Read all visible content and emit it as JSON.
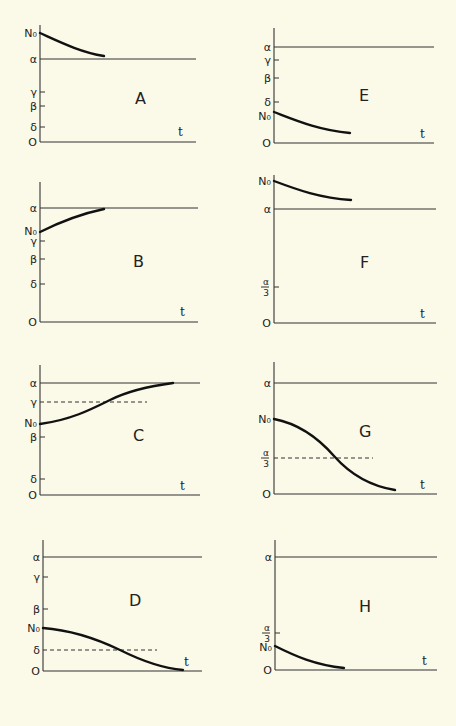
{
  "figure": {
    "background": "#fbf9e8",
    "ink": "#222222",
    "panels": [
      {
        "id": "A",
        "label": "A",
        "axis_x": 40,
        "zero_y": 142,
        "top_y": 25,
        "end_x": 196,
        "t_label": "t",
        "t_pos": [
          178,
          136
        ],
        "label_pos": [
          135,
          104
        ],
        "alpha_line_y": 59,
        "ticks": [
          {
            "name": "N0",
            "text": "N₀",
            "y": 33,
            "tick": false
          },
          {
            "name": "alpha",
            "text": "α",
            "y": 59,
            "tick": false
          },
          {
            "name": "gamma",
            "text": "γ",
            "y": 92,
            "tick": true
          },
          {
            "name": "beta",
            "text": "β",
            "y": 106,
            "tick": true
          },
          {
            "name": "delta",
            "text": "δ",
            "y": 127,
            "tick": true
          },
          {
            "name": "zero",
            "text": "O",
            "y": 142,
            "tick": false
          }
        ],
        "dashed": null,
        "curve": "M40 33 C 60 42, 80 52, 104 56"
      },
      {
        "id": "E",
        "label": "E",
        "axis_x": 274,
        "zero_y": 143,
        "top_y": 28,
        "end_x": 434,
        "t_label": "t",
        "t_pos": [
          420,
          138
        ],
        "label_pos": [
          359,
          101
        ],
        "alpha_line_y": 47,
        "ticks": [
          {
            "name": "alpha",
            "text": "α",
            "y": 47,
            "tick": false
          },
          {
            "name": "gamma",
            "text": "γ",
            "y": 60,
            "tick": true
          },
          {
            "name": "beta",
            "text": "β",
            "y": 78,
            "tick": true
          },
          {
            "name": "delta",
            "text": "δ",
            "y": 102,
            "tick": true
          },
          {
            "name": "N0",
            "text": "N₀",
            "y": 116,
            "tick": false
          },
          {
            "name": "zero",
            "text": "O",
            "y": 143,
            "tick": false
          }
        ],
        "dashed": null,
        "curve": "M274 112 C 295 120, 318 130, 350 133"
      },
      {
        "id": "B",
        "label": "B",
        "axis_x": 40,
        "zero_y": 322,
        "top_y": 182,
        "end_x": 198,
        "t_label": "t",
        "t_pos": [
          180,
          316
        ],
        "label_pos": [
          133,
          267
        ],
        "alpha_line_y": 208,
        "ticks": [
          {
            "name": "alpha",
            "text": "α",
            "y": 208,
            "tick": false
          },
          {
            "name": "N0",
            "text": "N₀",
            "y": 231,
            "tick": false
          },
          {
            "name": "gamma",
            "text": "γ",
            "y": 241,
            "tick": true
          },
          {
            "name": "beta",
            "text": "β",
            "y": 259,
            "tick": true
          },
          {
            "name": "delta",
            "text": "δ",
            "y": 284,
            "tick": true
          },
          {
            "name": "zero",
            "text": "O",
            "y": 322,
            "tick": false
          }
        ],
        "dashed": null,
        "curve": "M40 232 C 60 222, 80 214, 104 209"
      },
      {
        "id": "F",
        "label": "F",
        "axis_x": 274,
        "zero_y": 323,
        "top_y": 175,
        "end_x": 436,
        "t_label": "t",
        "t_pos": [
          420,
          318
        ],
        "label_pos": [
          360,
          268
        ],
        "alpha_line_y": 209,
        "ticks": [
          {
            "name": "N0",
            "text": "N₀",
            "y": 181,
            "tick": false
          },
          {
            "name": "alpha",
            "text": "α",
            "y": 209,
            "tick": false
          },
          {
            "name": "alpha-over-3",
            "text_num": "α",
            "text_den": "3",
            "y": 287,
            "tick": true,
            "fraction": true
          },
          {
            "name": "zero",
            "text": "O",
            "y": 323,
            "tick": false
          }
        ],
        "dashed": null,
        "curve": "M274 181 C 298 190, 320 198, 351 200"
      },
      {
        "id": "C",
        "label": "C",
        "axis_x": 40,
        "zero_y": 495,
        "top_y": 365,
        "end_x": 200,
        "t_label": "t",
        "t_pos": [
          180,
          490
        ],
        "label_pos": [
          133,
          441
        ],
        "alpha_line_y": 383,
        "ticks": [
          {
            "name": "alpha",
            "text": "α",
            "y": 383,
            "tick": false
          },
          {
            "name": "gamma",
            "text": "γ",
            "y": 402,
            "tick": false
          },
          {
            "name": "N0",
            "text": "N₀",
            "y": 423,
            "tick": false
          },
          {
            "name": "beta",
            "text": "β",
            "y": 437,
            "tick": true
          },
          {
            "name": "delta",
            "text": "δ",
            "y": 479,
            "tick": true
          },
          {
            "name": "zero",
            "text": "O",
            "y": 495,
            "tick": false
          }
        ],
        "dashed": {
          "label": "γ",
          "y": 402,
          "x_end": 147
        },
        "curve": "M40 424 C 70 420, 90 410, 110 400 C 130 390, 150 386, 173 383"
      },
      {
        "id": "G",
        "label": "G",
        "axis_x": 274,
        "zero_y": 494,
        "top_y": 362,
        "end_x": 437,
        "t_label": "t",
        "t_pos": [
          420,
          489
        ],
        "label_pos": [
          359,
          437
        ],
        "alpha_line_y": 383,
        "ticks": [
          {
            "name": "alpha",
            "text": "α",
            "y": 383,
            "tick": false
          },
          {
            "name": "N0",
            "text": "N₀",
            "y": 419,
            "tick": false
          },
          {
            "name": "alpha-over-3",
            "text_num": "α",
            "text_den": "3",
            "y": 458,
            "tick": false,
            "fraction": true
          },
          {
            "name": "zero",
            "text": "O",
            "y": 494,
            "tick": false
          }
        ],
        "dashed": {
          "label": "α/3",
          "y": 458,
          "x_end": 373
        },
        "curve": "M274 419 C 300 424, 320 440, 334 456 C 350 474, 370 486, 395 490"
      },
      {
        "id": "D",
        "label": "D",
        "axis_x": 43,
        "zero_y": 671,
        "top_y": 540,
        "end_x": 202,
        "t_label": "t",
        "t_pos": [
          184,
          666
        ],
        "label_pos": [
          129,
          606
        ],
        "alpha_line_y": 557,
        "ticks": [
          {
            "name": "alpha",
            "text": "α",
            "y": 557,
            "tick": false
          },
          {
            "name": "gamma",
            "text": "γ",
            "y": 577,
            "tick": true
          },
          {
            "name": "beta",
            "text": "β",
            "y": 609,
            "tick": true
          },
          {
            "name": "N0",
            "text": "N₀",
            "y": 628,
            "tick": false
          },
          {
            "name": "delta",
            "text": "δ",
            "y": 650,
            "tick": false
          },
          {
            "name": "zero",
            "text": "O",
            "y": 671,
            "tick": false
          }
        ],
        "dashed": {
          "label": "δ",
          "y": 650,
          "x_end": 157
        },
        "curve": "M43 628 C 70 630, 95 638, 120 650 C 140 660, 160 668, 183 670"
      },
      {
        "id": "H",
        "label": "H",
        "axis_x": 275,
        "zero_y": 670,
        "top_y": 540,
        "end_x": 437,
        "t_label": "t",
        "t_pos": [
          422,
          665
        ],
        "label_pos": [
          359,
          612
        ],
        "alpha_line_y": 557,
        "ticks": [
          {
            "name": "alpha",
            "text": "α",
            "y": 557,
            "tick": false
          },
          {
            "name": "alpha-over-3",
            "text_num": "α",
            "text_den": "3",
            "y": 633,
            "tick": true,
            "fraction": true
          },
          {
            "name": "N0",
            "text": "N₀",
            "y": 647,
            "tick": false
          },
          {
            "name": "zero",
            "text": "O",
            "y": 670,
            "tick": false
          }
        ],
        "dashed": null,
        "curve": "M275 646 C 295 656, 315 665, 344 668"
      }
    ]
  }
}
